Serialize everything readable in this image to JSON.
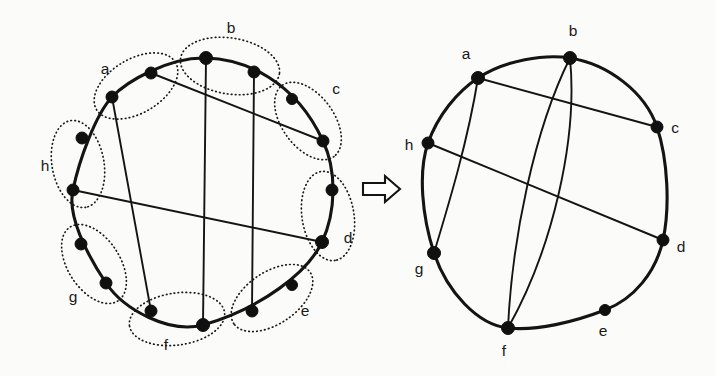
{
  "figure": {
    "background_color": "#fbfbf9",
    "ink_color": "#141414",
    "arrow": {
      "name": "double-arrow-right",
      "glyph": "⇒"
    }
  },
  "left_diagram": {
    "name": "expanded-circle-graph",
    "vertex_count": 16,
    "group_count": 8,
    "group_labels": [
      "a",
      "b",
      "c",
      "d",
      "e",
      "f",
      "g",
      "h"
    ],
    "labels": [
      {
        "text": "a",
        "x": 105,
        "y": 74
      },
      {
        "text": "b",
        "x": 231,
        "y": 33
      },
      {
        "text": "c",
        "x": 336,
        "y": 94
      },
      {
        "text": "d",
        "x": 348,
        "y": 243
      },
      {
        "text": "e",
        "x": 305,
        "y": 316
      },
      {
        "text": "f",
        "x": 166,
        "y": 350
      },
      {
        "text": "g",
        "x": 73,
        "y": 302
      },
      {
        "text": "h",
        "x": 45,
        "y": 171
      }
    ],
    "vertices": [
      {
        "id": "a1",
        "group": "a",
        "x": 112,
        "y": 97
      },
      {
        "id": "a2",
        "group": "a",
        "x": 151,
        "y": 73
      },
      {
        "id": "b1",
        "group": "b",
        "x": 206,
        "y": 58
      },
      {
        "id": "b2",
        "group": "b",
        "x": 254,
        "y": 72
      },
      {
        "id": "c1",
        "group": "c",
        "x": 292,
        "y": 99
      },
      {
        "id": "c2",
        "group": "c",
        "x": 323,
        "y": 141
      },
      {
        "id": "d1",
        "group": "d",
        "x": 332,
        "y": 190
      },
      {
        "id": "d2",
        "group": "d",
        "x": 322,
        "y": 242
      },
      {
        "id": "e1",
        "group": "e",
        "x": 292,
        "y": 285
      },
      {
        "id": "e2",
        "group": "e",
        "x": 252,
        "y": 311
      },
      {
        "id": "f1",
        "group": "f",
        "x": 203,
        "y": 325
      },
      {
        "id": "f2",
        "group": "f",
        "x": 151,
        "y": 311
      },
      {
        "id": "g1",
        "group": "g",
        "x": 106,
        "y": 283
      },
      {
        "id": "g2",
        "group": "g",
        "x": 81,
        "y": 244
      },
      {
        "id": "h1",
        "group": "h",
        "x": 73,
        "y": 190
      },
      {
        "id": "h2",
        "group": "h",
        "x": 82,
        "y": 138
      }
    ],
    "chords": [
      {
        "from": "a2",
        "to": "c2",
        "kind": "straight"
      },
      {
        "from": "h1",
        "to": "d2",
        "kind": "straight"
      },
      {
        "from": "a1",
        "to": "f2",
        "kind": "straight"
      },
      {
        "from": "b1",
        "to": "f1",
        "kind": "straight"
      },
      {
        "from": "b2",
        "to": "e2",
        "kind": "straight"
      }
    ],
    "group_ellipses": [
      {
        "group": "a",
        "cx": 136,
        "cy": 86,
        "rx": 46,
        "ry": 27,
        "rot": -31
      },
      {
        "group": "b",
        "cx": 230,
        "cy": 66,
        "rx": 50,
        "ry": 28,
        "rot": 9
      },
      {
        "group": "c",
        "cx": 308,
        "cy": 121,
        "rx": 44,
        "ry": 26,
        "rot": 54
      },
      {
        "group": "d",
        "cx": 328,
        "cy": 216,
        "rx": 45,
        "ry": 26,
        "rot": 81
      },
      {
        "group": "e",
        "cx": 272,
        "cy": 298,
        "rx": 46,
        "ry": 26,
        "rot": 146
      },
      {
        "group": "f",
        "cx": 177,
        "cy": 319,
        "rx": 48,
        "ry": 26,
        "rot": 172
      },
      {
        "group": "g",
        "cx": 94,
        "cy": 264,
        "rx": 44,
        "ry": 26,
        "rot": 57
      },
      {
        "group": "h",
        "cx": 78,
        "cy": 164,
        "rx": 44,
        "ry": 26,
        "rot": 80
      }
    ]
  },
  "right_diagram": {
    "name": "contracted-circle-graph",
    "vertex_count": 8,
    "labels": [
      {
        "text": "a",
        "x": 466,
        "y": 59
      },
      {
        "text": "b",
        "x": 573,
        "y": 36
      },
      {
        "text": "c",
        "x": 670,
        "y": 131
      },
      {
        "text": "d",
        "x": 676,
        "y": 250
      },
      {
        "text": "e",
        "x": 601,
        "y": 334
      },
      {
        "text": "f",
        "x": 500,
        "y": 355
      },
      {
        "text": "g",
        "x": 418,
        "y": 270
      },
      {
        "text": "h",
        "x": 407,
        "y": 149
      }
    ],
    "vertices": [
      {
        "id": "a",
        "x": 478,
        "y": 78
      },
      {
        "id": "b",
        "x": 570,
        "y": 58
      },
      {
        "id": "c",
        "x": 657,
        "y": 127
      },
      {
        "id": "d",
        "x": 663,
        "y": 240
      },
      {
        "id": "e",
        "x": 605,
        "y": 310
      },
      {
        "id": "f",
        "x": 508,
        "y": 328
      },
      {
        "id": "g",
        "x": 434,
        "y": 253
      },
      {
        "id": "h",
        "x": 428,
        "y": 143
      }
    ],
    "edges": [
      {
        "from": "a",
        "to": "c",
        "kind": "straight"
      },
      {
        "from": "h",
        "to": "d",
        "kind": "straight"
      },
      {
        "from": "a",
        "to": "g",
        "kind": "curve"
      },
      {
        "from": "b",
        "to": "f",
        "kind": "curve-left"
      },
      {
        "from": "b",
        "to": "f",
        "kind": "curve-right"
      }
    ]
  }
}
